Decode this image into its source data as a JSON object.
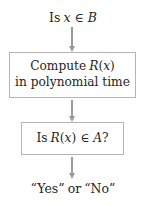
{
  "diagram": {
    "style": {
      "background": "#ffffff",
      "text_color": "#262626",
      "box_border_color": "#b5b5b5",
      "arrow_color": "#9a9a9a"
    },
    "nodes": [
      {
        "id": "start",
        "kind": "label",
        "text": "Is x ∈ B",
        "parts": [
          {
            "text": "Is",
            "style": "roman"
          },
          {
            "text": "x",
            "style": "italic"
          },
          {
            "text": "∈",
            "style": "operator"
          },
          {
            "text": "B",
            "style": "italic"
          }
        ]
      },
      {
        "id": "compute",
        "kind": "box",
        "text": "Compute R(x) in polynomial time",
        "lines": [
          {
            "text": "Compute R(x)",
            "parts": [
              {
                "text": "Compute",
                "style": "roman"
              },
              {
                "text": "R",
                "style": "italic"
              },
              {
                "text": "(",
                "style": "roman"
              },
              {
                "text": "x",
                "style": "italic"
              },
              {
                "text": ")",
                "style": "roman"
              }
            ]
          },
          {
            "text": "in polynomial time",
            "parts": [
              {
                "text": "in polynomial time",
                "style": "roman"
              }
            ]
          }
        ]
      },
      {
        "id": "decide",
        "kind": "box",
        "text": "Is R(x) ∈ A?",
        "lines": [
          {
            "text": "Is R(x) ∈ A?",
            "parts": [
              {
                "text": "Is",
                "style": "roman"
              },
              {
                "text": "R",
                "style": "italic"
              },
              {
                "text": "(",
                "style": "roman"
              },
              {
                "text": "x",
                "style": "italic"
              },
              {
                "text": ")",
                "style": "roman"
              },
              {
                "text": "∈",
                "style": "operator"
              },
              {
                "text": "A",
                "style": "italic"
              },
              {
                "text": "?",
                "style": "roman"
              }
            ]
          }
        ]
      },
      {
        "id": "end",
        "kind": "label",
        "text": "“Yes” or “No”",
        "parts": [
          {
            "text": "“Yes”",
            "style": "roman"
          },
          {
            "text": "or",
            "style": "roman"
          },
          {
            "text": "“No”",
            "style": "roman"
          }
        ]
      }
    ],
    "edges": [
      {
        "id": "edge-start-compute",
        "from": "start",
        "to": "compute",
        "label": "",
        "direction": "down"
      },
      {
        "id": "edge-compute-decide",
        "from": "compute",
        "to": "decide",
        "label": "",
        "direction": "down"
      },
      {
        "id": "edge-decide-end",
        "from": "decide",
        "to": "end",
        "label": "",
        "direction": "down"
      }
    ],
    "text": {
      "start_is": "Is",
      "start_var": "x",
      "in_operator": "∈",
      "start_set": "B",
      "compute_word": "Compute",
      "compute_fn": "R",
      "paren_open": "(",
      "compute_arg": "x",
      "paren_close": ")",
      "compute_line2": "in polynomial time",
      "decide_is": "Is",
      "decide_fn": "R",
      "decide_arg": "x",
      "decide_set": "A",
      "question_mark": "?",
      "end_yes": "“Yes”",
      "end_or": "or",
      "end_no": "“No”"
    }
  }
}
